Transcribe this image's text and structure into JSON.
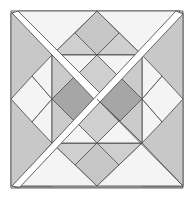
{
  "figure": {
    "title": "",
    "colors": {
      "white": "#f7f7f7",
      "light": "#dcdcdc",
      "mid": "#c4c4c4",
      "dark": "#a6a6a6",
      "stroke": "#555555",
      "band": "#ffffff"
    }
  }
}
